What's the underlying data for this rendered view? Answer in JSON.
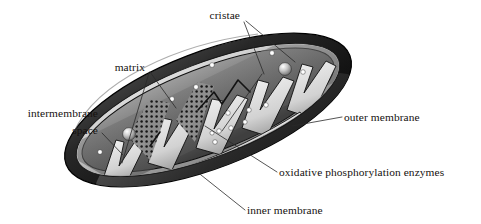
{
  "figure": {
    "style": "grayscale shaded illustration",
    "background_color": "#ffffff",
    "width": 481,
    "height": 224
  },
  "colors": {
    "outer_membrane_dark": "#1b1b1b",
    "outer_membrane_mid": "#3a3a3a",
    "inner_rim_light": "#d8d8d8",
    "matrix_gray": "#6e6e6e",
    "matrix_light": "#9a9a9a",
    "cristae_white": "#e9e9e9",
    "enzyme_dot": "#ffffff",
    "stipple_dot": "#141414",
    "leader_line": "#2a2a2a",
    "label_text": "#15110f"
  },
  "labels": [
    {
      "id": "cristae",
      "text": "cristae",
      "position": "top-center",
      "anchor": "end",
      "x": 240,
      "y": 19,
      "leader_count": 2
    },
    {
      "id": "matrix",
      "text": "matrix",
      "position": "upper-left",
      "anchor": "end",
      "x": 145,
      "y": 71,
      "leader_count": 2
    },
    {
      "id": "intermembrane-space",
      "text": "intermembrane",
      "text_line2": "space",
      "position": "left",
      "anchor": "end",
      "x": 98,
      "y": 117,
      "y2": 134,
      "leader_count": 1
    },
    {
      "id": "outer-membrane",
      "text": "outer membrane",
      "position": "right",
      "anchor": "start",
      "x": 344,
      "y": 121,
      "leader_count": 1
    },
    {
      "id": "oxidative-phosphorylation-enzymes",
      "text": "oxidative phosphorylation enzymes",
      "position": "lower-right",
      "anchor": "start",
      "x": 279,
      "y": 176,
      "leader_count": 1
    },
    {
      "id": "inner-membrane",
      "text": "inner membrane",
      "position": "bottom-center",
      "anchor": "start",
      "x": 247,
      "y": 214,
      "leader_count": 1
    }
  ],
  "structures": {
    "outer_membrane": "thick dark band forming the tilted elliptical boundary",
    "inner_membrane": "light band just inside the outer membrane, folding inward",
    "cristae": "white zigzag infoldings of the inner membrane crossing the matrix",
    "matrix": "gray compartments enclosed between the cristae folds",
    "intermembrane_space": "narrow gap between outer and inner membranes",
    "enzymes": "small white dots studding the matrix faces",
    "granules": "larger highlighted spheres within the matrix",
    "stipple_regions": "dense black dot texture on two left-hand cristae faces"
  }
}
